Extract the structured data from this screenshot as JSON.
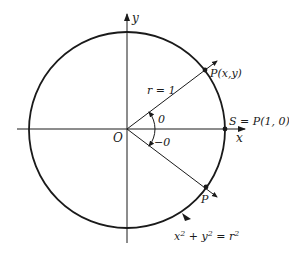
{
  "diagram": {
    "type": "unit-circle",
    "axes": {
      "x_label": "x",
      "y_label": "y",
      "origin_label": "O"
    },
    "radius_label": "r = 1",
    "points": [
      {
        "id": "P",
        "label": "P(x,y)"
      },
      {
        "id": "S",
        "label": "S = P(1, 0)"
      },
      {
        "id": "P_reflect",
        "label": "P"
      }
    ],
    "angles": {
      "positive": "0",
      "negative": "−0"
    },
    "equation": {
      "x": "x",
      "sup1": "2",
      "plus": " + ",
      "y": "y",
      "sup2": "2",
      "eq": " = ",
      "r": "r",
      "sup3": "2"
    },
    "colors": {
      "stroke": "#1a1a1a",
      "background": "#ffffff"
    }
  }
}
